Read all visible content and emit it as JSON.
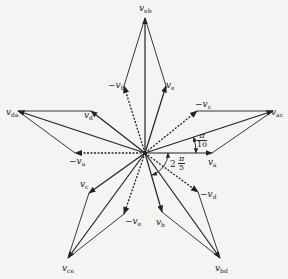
{
  "diagram": {
    "type": "phasor-diagram",
    "center": [
      145,
      153
    ],
    "colors": {
      "line": "#222222",
      "background": "#f4f4f2"
    },
    "phasors_solid": [
      {
        "name": "v_a",
        "tip": [
          212,
          153
        ]
      },
      {
        "name": "v_b",
        "tip": [
          162,
          212
        ]
      },
      {
        "name": "v_c",
        "tip": [
          89,
          193
        ]
      },
      {
        "name": "v_d",
        "tip": [
          91,
          111
        ]
      },
      {
        "name": "v_e",
        "tip": [
          166,
          86
        ]
      },
      {
        "name": "v_eb",
        "tip": [
          145,
          18
        ]
      },
      {
        "name": "v_ac",
        "tip": [
          273,
          111
        ]
      },
      {
        "name": "v_da",
        "tip": [
          18,
          111
        ]
      },
      {
        "name": "v_ce",
        "tip": [
          68,
          258
        ]
      },
      {
        "name": "v_bd",
        "tip": [
          220,
          258
        ]
      }
    ],
    "phasors_dashed": [
      {
        "name": "-v_a",
        "tip": [
          75,
          153
        ]
      },
      {
        "name": "-v_b",
        "tip": [
          124,
          86
        ]
      },
      {
        "name": "-v_c",
        "tip": [
          197,
          111
        ]
      },
      {
        "name": "-v_d",
        "tip": [
          198,
          192
        ]
      },
      {
        "name": "-v_e",
        "tip": [
          124,
          214
        ]
      }
    ],
    "completion_lines": [
      [
        [
          124,
          86
        ],
        [
          145,
          18
        ]
      ],
      [
        [
          166,
          86
        ],
        [
          145,
          18
        ]
      ],
      [
        [
          197,
          111
        ],
        [
          273,
          111
        ]
      ],
      [
        [
          212,
          153
        ],
        [
          273,
          111
        ]
      ],
      [
        [
          91,
          111
        ],
        [
          18,
          111
        ]
      ],
      [
        [
          75,
          153
        ],
        [
          18,
          111
        ]
      ],
      [
        [
          89,
          193
        ],
        [
          68,
          258
        ]
      ],
      [
        [
          124,
          214
        ],
        [
          68,
          258
        ]
      ],
      [
        [
          162,
          212
        ],
        [
          220,
          258
        ]
      ],
      [
        [
          198,
          192
        ],
        [
          220,
          258
        ]
      ]
    ]
  },
  "labels": {
    "v_eb": {
      "main": "v",
      "sub": "eb"
    },
    "v_ac": {
      "main": "v",
      "sub": "ac"
    },
    "v_da": {
      "main": "v",
      "sub": "da"
    },
    "v_ce": {
      "main": "v",
      "sub": "ce"
    },
    "v_bd": {
      "main": "v",
      "sub": "bd"
    },
    "v_a": {
      "main": "v",
      "sub": "a"
    },
    "neg_v_a": {
      "main": "−v",
      "sub": "a"
    },
    "v_b": {
      "main": "v",
      "sub": "b"
    },
    "neg_v_b": {
      "main": "−v",
      "sub": "b"
    },
    "v_c": {
      "main": "v",
      "sub": "c"
    },
    "neg_v_c": {
      "main": "−v",
      "sub": "c"
    },
    "v_d": {
      "main": "v",
      "sub": "d"
    },
    "neg_v_d": {
      "main": "−v",
      "sub": "d"
    },
    "v_e": {
      "main": "v",
      "sub": "e"
    },
    "neg_v_e": {
      "main": "−v",
      "sub": "e"
    }
  },
  "angles": {
    "small": {
      "num": "π",
      "den": "10"
    },
    "large": {
      "coef": "2",
      "num": "π",
      "den": "5"
    }
  }
}
